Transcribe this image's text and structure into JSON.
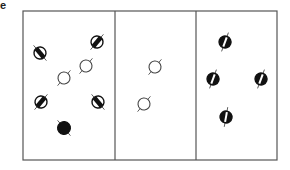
{
  "figure": {
    "panel_label": "e",
    "frame": {
      "x": 23,
      "y": 11,
      "width": 254,
      "height": 149,
      "stroke": "#555555"
    },
    "dividers_x": [
      115,
      196
    ],
    "colors": {
      "ink": "#111111",
      "outline": "#444444",
      "fill_dark": "#111111",
      "fill_empty": "#ffffff"
    }
  },
  "panels": [
    {
      "name": "panel-left",
      "particles": [
        {
          "type": "half-filled-diagonal",
          "cx": 40,
          "cy": 53,
          "angle": -40
        },
        {
          "type": "half-filled-diagonal",
          "cx": 97,
          "cy": 42,
          "angle": 40
        },
        {
          "type": "open-circle",
          "cx": 64,
          "cy": 78,
          "angle": 40
        },
        {
          "type": "open-circle",
          "cx": 86,
          "cy": 66,
          "angle": 40
        },
        {
          "type": "half-filled-diagonal",
          "cx": 41,
          "cy": 102,
          "angle": 40
        },
        {
          "type": "half-filled-diagonal",
          "cx": 98,
          "cy": 102,
          "angle": -40
        },
        {
          "type": "filled-circle",
          "cx": 64,
          "cy": 128,
          "angle": -40
        }
      ]
    },
    {
      "name": "panel-middle",
      "particles": [
        {
          "type": "open-circle",
          "cx": 155,
          "cy": 67,
          "angle": 40
        },
        {
          "type": "open-circle",
          "cx": 144,
          "cy": 104,
          "angle": 40
        }
      ]
    },
    {
      "name": "panel-right",
      "particles": [
        {
          "type": "half-filled-vertical",
          "cx": 225,
          "cy": 42,
          "angle": 20
        },
        {
          "type": "half-filled-vertical",
          "cx": 213,
          "cy": 79,
          "angle": 20
        },
        {
          "type": "half-filled-vertical",
          "cx": 261,
          "cy": 79,
          "angle": 20
        },
        {
          "type": "half-filled-vertical",
          "cx": 226,
          "cy": 117,
          "angle": 10
        }
      ]
    }
  ]
}
